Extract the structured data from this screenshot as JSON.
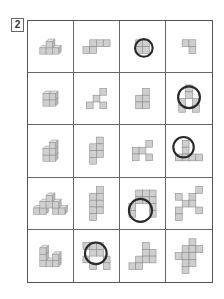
{
  "question_number": "2",
  "colors": {
    "square_fill": "#cfcfcf",
    "square_stroke": "#8a8a8a",
    "circle_stroke": "#2a2a2a",
    "grid_line": "#555555"
  },
  "unit": 7,
  "rows": [
    [
      {
        "type": "cubes3d",
        "desc": "stepped cube stack, 3 bottom, 1 top",
        "cubes": [
          [
            0,
            0,
            0
          ],
          [
            1,
            0,
            0
          ],
          [
            2,
            0,
            0
          ],
          [
            1,
            0,
            1
          ]
        ]
      },
      {
        "type": "flat",
        "squares": [
          [
            1,
            0
          ],
          [
            2,
            0
          ],
          [
            3,
            0
          ],
          [
            0,
            1
          ],
          [
            1,
            1
          ]
        ]
      },
      {
        "type": "flat",
        "circled": true,
        "squares": [
          [
            0,
            0
          ],
          [
            1,
            0
          ],
          [
            0,
            1
          ],
          [
            1,
            1
          ]
        ],
        "circle": [
          1.2,
          1.2,
          1.3
        ]
      },
      {
        "type": "flat",
        "squares": [
          [
            0,
            0
          ],
          [
            1,
            0
          ],
          [
            1,
            1
          ]
        ]
      }
    ],
    [
      {
        "type": "cubes3d",
        "desc": "2x2 block of cubes two high",
        "cubes": [
          [
            0,
            0,
            0
          ],
          [
            1,
            0,
            0
          ],
          [
            0,
            0,
            1
          ],
          [
            1,
            0,
            1
          ]
        ]
      },
      {
        "type": "flat",
        "squares": [
          [
            2,
            0
          ],
          [
            1,
            1
          ],
          [
            0,
            2
          ],
          [
            2,
            2
          ]
        ]
      },
      {
        "type": "flat",
        "squares": [
          [
            1,
            0
          ],
          [
            0,
            1
          ],
          [
            1,
            1
          ],
          [
            0,
            2
          ],
          [
            1,
            2
          ]
        ]
      },
      {
        "type": "flat",
        "circled": true,
        "squares": [
          [
            1,
            0
          ],
          [
            1,
            1
          ],
          [
            0,
            2
          ],
          [
            2,
            2
          ],
          [
            0,
            3
          ],
          [
            2,
            3
          ]
        ],
        "circle": [
          1.5,
          1.8,
          1.6
        ]
      }
    ],
    [
      {
        "type": "cubes3d",
        "desc": "staircase of cubes",
        "cubes": [
          [
            0,
            0,
            0
          ],
          [
            1,
            0,
            0
          ],
          [
            0,
            0,
            1
          ],
          [
            1,
            0,
            1
          ],
          [
            1,
            0,
            2
          ]
        ]
      },
      {
        "type": "flat",
        "squares": [
          [
            1,
            0
          ],
          [
            0,
            1
          ],
          [
            1,
            1
          ],
          [
            0,
            2
          ],
          [
            1,
            2
          ],
          [
            0,
            3
          ]
        ]
      },
      {
        "type": "flat",
        "squares": [
          [
            2,
            0
          ],
          [
            0,
            1
          ],
          [
            1,
            1
          ],
          [
            0,
            2
          ],
          [
            2,
            2
          ]
        ]
      },
      {
        "type": "flat",
        "circled": true,
        "squares": [
          [
            1,
            0
          ],
          [
            1,
            1
          ],
          [
            0,
            2
          ],
          [
            1,
            2
          ],
          [
            2,
            2
          ],
          [
            3,
            2
          ]
        ],
        "circle": [
          1.2,
          1.0,
          1.5
        ]
      }
    ],
    [
      {
        "type": "cubes3d",
        "desc": "pyramid arrangement of cubes",
        "cubes": [
          [
            0,
            0,
            0
          ],
          [
            1,
            0,
            0
          ],
          [
            3,
            0,
            0
          ],
          [
            4,
            0,
            0
          ],
          [
            1,
            0,
            1
          ],
          [
            2,
            0,
            1
          ],
          [
            3,
            0,
            1
          ],
          [
            2,
            0,
            2
          ]
        ]
      },
      {
        "type": "flat",
        "squares": [
          [
            1,
            0
          ],
          [
            0,
            1
          ],
          [
            1,
            1
          ],
          [
            0,
            2
          ],
          [
            1,
            2
          ],
          [
            0,
            3
          ],
          [
            1,
            3
          ],
          [
            0,
            4
          ]
        ]
      },
      {
        "type": "flat",
        "circled": true,
        "squares": [
          [
            1,
            0
          ],
          [
            2,
            0
          ],
          [
            3,
            0
          ],
          [
            1,
            1
          ],
          [
            2,
            1
          ],
          [
            3,
            1
          ],
          [
            0,
            2
          ],
          [
            3,
            2
          ],
          [
            0,
            3
          ],
          [
            3,
            3
          ]
        ],
        "circle": [
          1.7,
          3.0,
          1.7
        ]
      },
      {
        "type": "flat",
        "squares": [
          [
            3,
            0
          ],
          [
            0,
            1
          ],
          [
            2,
            1
          ],
          [
            1,
            2
          ],
          [
            2,
            2
          ],
          [
            0,
            3
          ],
          [
            3,
            3
          ],
          [
            0,
            4
          ]
        ]
      }
    ],
    [
      {
        "type": "cubes3d",
        "desc": "L-shaped arrangement of cubes",
        "cubes": [
          [
            0,
            0,
            0
          ],
          [
            1,
            0,
            0
          ],
          [
            2,
            0,
            0
          ],
          [
            0,
            0,
            1
          ],
          [
            0,
            0,
            2
          ],
          [
            2,
            0,
            1
          ]
        ]
      },
      {
        "type": "flat",
        "circled": true,
        "squares": [
          [
            0,
            0
          ],
          [
            1,
            0
          ],
          [
            2,
            0
          ],
          [
            1,
            1
          ],
          [
            2,
            1
          ],
          [
            0,
            2
          ],
          [
            3,
            2
          ],
          [
            1,
            3
          ],
          [
            3,
            3
          ]
        ],
        "circle": [
          1.9,
          1.6,
          1.6
        ]
      },
      {
        "type": "flat",
        "squares": [
          [
            2,
            0
          ],
          [
            2,
            1
          ],
          [
            3,
            1
          ],
          [
            1,
            2
          ],
          [
            2,
            2
          ],
          [
            3,
            2
          ],
          [
            0,
            3
          ],
          [
            1,
            3
          ]
        ]
      },
      {
        "type": "flat",
        "squares": [
          [
            2,
            0
          ],
          [
            1,
            1
          ],
          [
            2,
            1
          ],
          [
            3,
            1
          ],
          [
            0,
            2
          ],
          [
            1,
            2
          ],
          [
            2,
            2
          ],
          [
            1,
            3
          ],
          [
            2,
            3
          ],
          [
            1,
            4
          ]
        ]
      }
    ]
  ]
}
